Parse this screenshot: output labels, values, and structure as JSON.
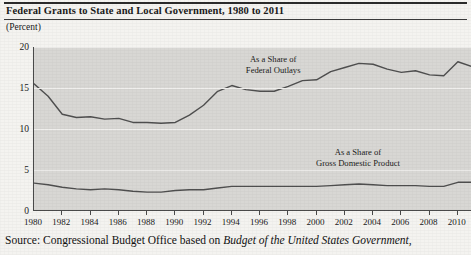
{
  "header": {
    "title": "Federal Grants to State and Local Government, 1980 to 2011",
    "unit_label": "(Percent)"
  },
  "source": {
    "prefix": "Source: Congressional Budget Office based on ",
    "italic": "Budget of the United States Government,"
  },
  "colors": {
    "plot_background": "#d8d7d4",
    "page_background": "#f4f3f0",
    "line": "#4f4f4f",
    "gridline": "#f0efed",
    "axis": "#4a4a4a",
    "text": "#1a1a1a"
  },
  "chart_data": {
    "type": "line",
    "title": "Federal Grants to State and Local Government, 1980 to 2011",
    "xlabel": "",
    "ylabel": "(Percent)",
    "xlim": [
      1980,
      2011
    ],
    "ylim": [
      0,
      20
    ],
    "yticks": [
      0,
      5,
      10,
      15,
      20
    ],
    "ytick_labels": [
      "0",
      "5",
      "10",
      "15",
      "20"
    ],
    "xticks": [
      1980,
      1982,
      1984,
      1986,
      1988,
      1990,
      1992,
      1994,
      1996,
      1998,
      2000,
      2002,
      2004,
      2006,
      2008,
      2010
    ],
    "xtick_labels": [
      "1980",
      "1982",
      "1984",
      "1986",
      "1988",
      "1990",
      "1992",
      "1994",
      "1996",
      "1998",
      "2000",
      "2002",
      "2004",
      "2006",
      "2008",
      "2010"
    ],
    "grid": true,
    "legend_position": "inline-annotation",
    "x": [
      1980,
      1981,
      1982,
      1983,
      1984,
      1985,
      1986,
      1987,
      1988,
      1989,
      1990,
      1991,
      1992,
      1993,
      1994,
      1995,
      1996,
      1997,
      1998,
      1999,
      2000,
      2001,
      2002,
      2003,
      2004,
      2005,
      2006,
      2007,
      2008,
      2009,
      2010,
      2011
    ],
    "series": [
      {
        "name": "As a Share of Federal Outlays",
        "annotation_line1": "As a Share of",
        "annotation_line2": "Federal Outlays",
        "values": [
          15.5,
          14.0,
          11.8,
          11.4,
          11.5,
          11.2,
          11.3,
          10.8,
          10.8,
          10.7,
          10.8,
          11.7,
          12.9,
          14.6,
          15.3,
          14.8,
          14.6,
          14.6,
          15.2,
          15.9,
          16.0,
          17.0,
          17.5,
          18.0,
          17.9,
          17.3,
          16.9,
          17.1,
          16.6,
          16.5,
          18.2,
          17.6
        ]
      },
      {
        "name": "As a Share of Gross Domestic Product",
        "annotation_line1": "As a Share of",
        "annotation_line2": "Gross Domestic Product",
        "values": [
          3.4,
          3.2,
          2.9,
          2.7,
          2.6,
          2.7,
          2.6,
          2.4,
          2.3,
          2.3,
          2.5,
          2.6,
          2.6,
          2.8,
          3.0,
          3.0,
          3.0,
          3.0,
          3.0,
          3.0,
          3.0,
          3.1,
          3.2,
          3.3,
          3.2,
          3.1,
          3.1,
          3.1,
          3.0,
          3.0,
          3.5,
          3.5
        ]
      }
    ],
    "annotations": [
      {
        "text": "As a Share of Federal Outlays",
        "at_year": 1997,
        "at_value": 17.8
      },
      {
        "text": "As a Share of Gross Domestic Product",
        "at_year": 2003,
        "at_value": 6.5
      }
    ]
  }
}
